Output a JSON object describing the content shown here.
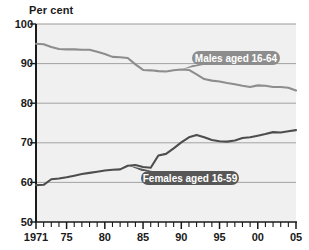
{
  "chart_data": {
    "type": "line",
    "title": "",
    "axis_title": "Per cent",
    "xlabel": "",
    "ylabel": "Per cent",
    "ylim": [
      50,
      100
    ],
    "xlim": [
      1971,
      2005
    ],
    "yticks": [
      50,
      60,
      70,
      80,
      90,
      100
    ],
    "ytick_labels": [
      "50",
      "60",
      "70",
      "80",
      "90",
      "100"
    ],
    "xticks": [
      1971,
      1975,
      1980,
      1985,
      1990,
      1995,
      2000,
      2005
    ],
    "xtick_labels": [
      "1971",
      "75",
      "80",
      "85",
      "90",
      "95",
      "00",
      "05"
    ],
    "minor_xticks_every": 1,
    "grid": "horizontal",
    "legend_position": "inline-callouts",
    "x": [
      1971,
      1972,
      1973,
      1974,
      1975,
      1976,
      1977,
      1978,
      1979,
      1980,
      1981,
      1982,
      1983,
      1984,
      1985,
      1986,
      1987,
      1988,
      1989,
      1990,
      1991,
      1992,
      1993,
      1994,
      1995,
      1996,
      1997,
      1998,
      1999,
      2000,
      2001,
      2002,
      2003,
      2004,
      2005
    ],
    "series": [
      {
        "name": "Males aged 16-64",
        "color": "#8d8d8d",
        "values": [
          95.0,
          94.9,
          94.2,
          93.7,
          93.6,
          93.6,
          93.5,
          93.5,
          93.0,
          92.4,
          91.7,
          91.6,
          91.4,
          89.8,
          88.4,
          88.3,
          88.1,
          88.0,
          88.3,
          88.5,
          88.4,
          87.3,
          86.1,
          85.7,
          85.5,
          85.1,
          84.8,
          84.4,
          84.1,
          84.5,
          84.4,
          84.1,
          84.1,
          83.9,
          83.2
        ]
      },
      {
        "name": "Females aged 16-59",
        "color": "#4d4d4d",
        "values": [
          59.3,
          59.4,
          60.8,
          61.0,
          61.3,
          61.7,
          62.1,
          62.4,
          62.7,
          63.0,
          63.2,
          63.3,
          64.2,
          64.4,
          63.9,
          63.7,
          66.8,
          67.2,
          68.6,
          70.1,
          71.4,
          72.0,
          71.4,
          70.7,
          70.4,
          70.3,
          70.6,
          71.2,
          71.4,
          71.8,
          72.2,
          72.7,
          72.6,
          72.9,
          73.2
        ]
      }
    ],
    "annotations": [
      {
        "name": "males-callout",
        "label": "Males aged 16-64",
        "fill": "#8d8d8d",
        "text_color": "#ffffff",
        "points_to_year": 1990,
        "points_to_value": 88.5
      },
      {
        "name": "females-callout",
        "label": "Females aged 16-59",
        "fill": "#575757",
        "text_color": "#ffffff",
        "points_to_year": 1983,
        "points_to_value": 64.3
      }
    ],
    "colors": {
      "plot_background": "#f0f0f0",
      "page_background": "#ffffff",
      "gridline": "#9a9a9a",
      "axis": "#1a1a1a",
      "tick_text": "#1a1a1a"
    }
  }
}
